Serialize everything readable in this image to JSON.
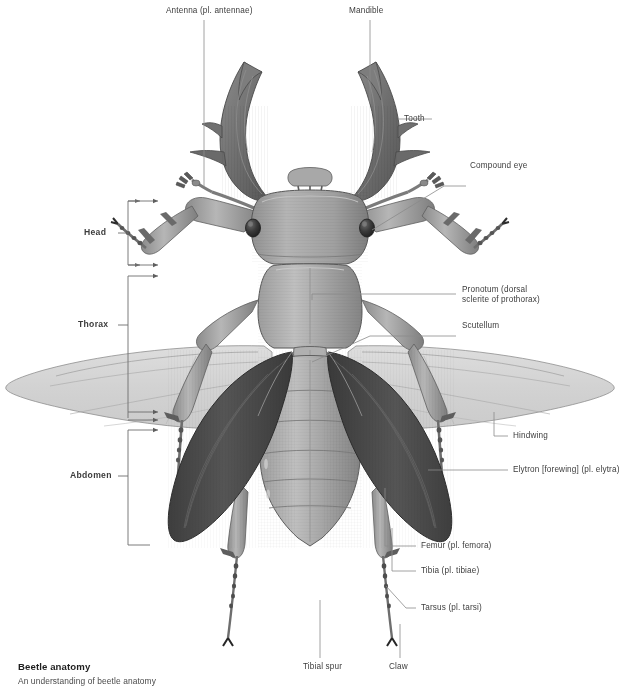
{
  "figure": {
    "title": "Beetle anatomy",
    "accent_color": "#4a4a4a",
    "leader_color": "#7a7a7a",
    "label_color": "#3c3c3c"
  },
  "labels": {
    "antenna": {
      "text": "Antenna (pl. antennae)",
      "x": 166,
      "y": 6
    },
    "mandible": {
      "text": "Mandible",
      "x": 349,
      "y": 6
    },
    "tooth": {
      "text": "Tooth",
      "x": 404,
      "y": 115
    },
    "compound_eye": {
      "text": "Compound eye",
      "x": 470,
      "y": 162
    },
    "pronotum_1": {
      "text": "Pronotum (dorsal",
      "x": 462,
      "y": 287
    },
    "pronotum_2": {
      "text": "sclerite of prothorax)",
      "x": 462,
      "y": 297
    },
    "scutellum": {
      "text": "Scutellum",
      "x": 462,
      "y": 322
    },
    "hindwing": {
      "text": "Hindwing",
      "x": 513,
      "y": 432
    },
    "elytron": {
      "text": "Elytron [forewing] (pl. elytra)",
      "x": 513,
      "y": 466
    },
    "femur": {
      "text": "Femur (pl. femora)",
      "x": 421,
      "y": 542
    },
    "tibia": {
      "text": "Tibia (pl. tibiae)",
      "x": 421,
      "y": 567
    },
    "tarsus": {
      "text": "Tarsus (pl. tarsi)",
      "x": 421,
      "y": 604
    },
    "tibial_spur": {
      "text": "Tibial spur",
      "x": 303,
      "y": 667
    },
    "claw": {
      "text": "Claw",
      "x": 389,
      "y": 667
    }
  },
  "region_labels": {
    "head": {
      "text": "Head",
      "x": 84,
      "y": 230
    },
    "thorax": {
      "text": "Thorax",
      "x": 78,
      "y": 322
    },
    "abdomen": {
      "text": "Abdomen",
      "x": 70,
      "y": 473
    }
  },
  "caption": {
    "title": "Beetle anatomy",
    "subtitle": "An understanding of beetle anatomy"
  }
}
